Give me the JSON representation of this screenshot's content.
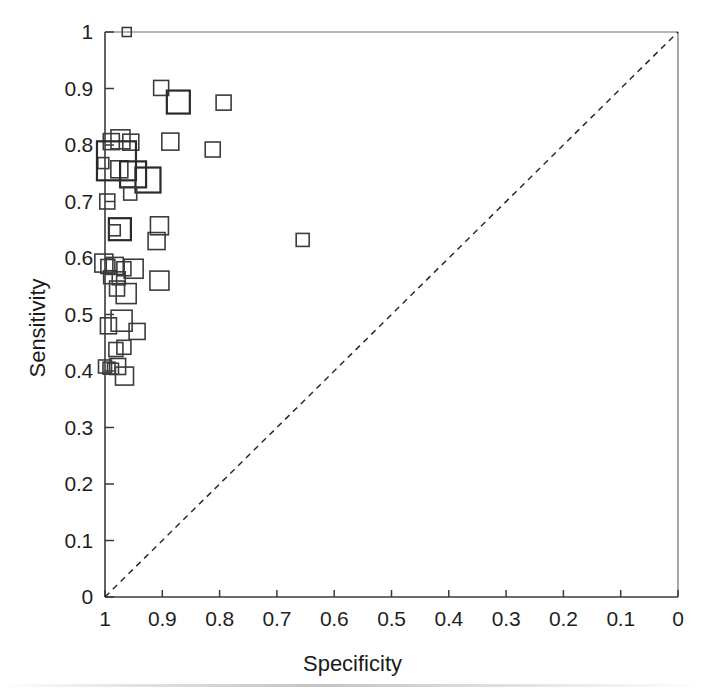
{
  "chart_data": {
    "type": "scatter",
    "title": "",
    "xlabel": "Specificity",
    "ylabel": "Sensitivity",
    "xlim": [
      1,
      0
    ],
    "ylim": [
      0,
      1
    ],
    "x_reversed": true,
    "grid": false,
    "legend": null,
    "xticks": [
      "1",
      "0.9",
      "0.8",
      "0.7",
      "0.6",
      "0.5",
      "0.4",
      "0.3",
      "0.2",
      "0.1",
      "0"
    ],
    "xtick_values": [
      1,
      0.9,
      0.8,
      0.7,
      0.6,
      0.5,
      0.4,
      0.3,
      0.2,
      0.1,
      0
    ],
    "yticks": [
      "0",
      "0.1",
      "0.2",
      "0.3",
      "0.4",
      "0.5",
      "0.6",
      "0.7",
      "0.8",
      "0.9",
      "1"
    ],
    "ytick_values": [
      0,
      0.1,
      0.2,
      0.3,
      0.4,
      0.5,
      0.6,
      0.7,
      0.8,
      0.9,
      1
    ],
    "marker": "open-square",
    "marker_size_encodes": "study-weight",
    "annotations": [
      {
        "name": "reference-diagonal",
        "type": "dashed-line",
        "from": [
          1,
          0
        ],
        "to": [
          0,
          1
        ]
      }
    ],
    "points": [
      {
        "x": 0.962,
        "y": 1.0,
        "size": 9
      },
      {
        "x": 0.902,
        "y": 0.901,
        "size": 15
      },
      {
        "x": 0.872,
        "y": 0.876,
        "size": 23
      },
      {
        "x": 0.793,
        "y": 0.875,
        "size": 15
      },
      {
        "x": 0.989,
        "y": 0.806,
        "size": 16
      },
      {
        "x": 0.973,
        "y": 0.81,
        "size": 19
      },
      {
        "x": 0.955,
        "y": 0.805,
        "size": 16
      },
      {
        "x": 0.886,
        "y": 0.806,
        "size": 17
      },
      {
        "x": 0.812,
        "y": 0.792,
        "size": 15
      },
      {
        "x": 1.003,
        "y": 0.768,
        "size": 11
      },
      {
        "x": 0.98,
        "y": 0.772,
        "size": 39
      },
      {
        "x": 0.975,
        "y": 0.757,
        "size": 17
      },
      {
        "x": 0.951,
        "y": 0.748,
        "size": 26
      },
      {
        "x": 0.925,
        "y": 0.738,
        "size": 25
      },
      {
        "x": 0.956,
        "y": 0.714,
        "size": 13
      },
      {
        "x": 0.996,
        "y": 0.7,
        "size": 15
      },
      {
        "x": 0.974,
        "y": 0.651,
        "size": 22
      },
      {
        "x": 0.983,
        "y": 0.649,
        "size": 11
      },
      {
        "x": 0.905,
        "y": 0.657,
        "size": 18
      },
      {
        "x": 0.91,
        "y": 0.63,
        "size": 17
      },
      {
        "x": 0.655,
        "y": 0.632,
        "size": 13
      },
      {
        "x": 1.002,
        "y": 0.591,
        "size": 18
      },
      {
        "x": 0.995,
        "y": 0.585,
        "size": 14
      },
      {
        "x": 0.983,
        "y": 0.586,
        "size": 17
      },
      {
        "x": 0.967,
        "y": 0.581,
        "size": 14
      },
      {
        "x": 0.95,
        "y": 0.581,
        "size": 19
      },
      {
        "x": 0.991,
        "y": 0.566,
        "size": 13
      },
      {
        "x": 0.976,
        "y": 0.564,
        "size": 13
      },
      {
        "x": 0.905,
        "y": 0.56,
        "size": 19
      },
      {
        "x": 0.979,
        "y": 0.546,
        "size": 15
      },
      {
        "x": 0.963,
        "y": 0.537,
        "size": 20
      },
      {
        "x": 0.994,
        "y": 0.48,
        "size": 16
      },
      {
        "x": 0.971,
        "y": 0.489,
        "size": 21
      },
      {
        "x": 0.944,
        "y": 0.47,
        "size": 16
      },
      {
        "x": 0.981,
        "y": 0.438,
        "size": 14
      },
      {
        "x": 0.967,
        "y": 0.442,
        "size": 14
      },
      {
        "x": 1.0,
        "y": 0.408,
        "size": 13
      },
      {
        "x": 0.993,
        "y": 0.405,
        "size": 12
      },
      {
        "x": 0.986,
        "y": 0.404,
        "size": 11
      },
      {
        "x": 0.978,
        "y": 0.408,
        "size": 16
      },
      {
        "x": 0.966,
        "y": 0.391,
        "size": 18
      }
    ]
  },
  "figure": {
    "background_color": "#ffffff",
    "axis_color": "#3a3a3a",
    "marker_color": "#3c3c3c",
    "diagonal_color": "#2b2b2b"
  }
}
